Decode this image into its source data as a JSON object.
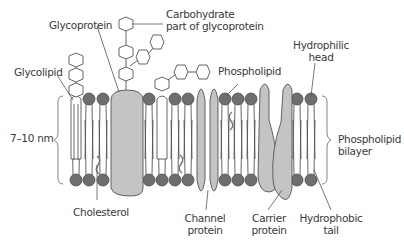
{
  "labels": {
    "glycoprotein": "Glycoprotein",
    "carbohydrate_line1": "Carbohydrate",
    "carbohydrate_line2": "part of glycoprotein",
    "glycolipid": "Glycolipid",
    "phospholipid": "Phospholipid",
    "hydrophilic_line1": "Hydrophilic",
    "hydrophilic_line2": "head",
    "thickness": "7–10 nm",
    "bilayer_line1": "Phospholipid",
    "bilayer_line2": "bilayer",
    "cholesterol": "Cholesterol",
    "channel_line1": "Channel",
    "channel_line2": "protein",
    "carrier_line1": "Carrier",
    "carrier_line2": "protein",
    "hydrophobic_line1": "Hydrophobic",
    "hydrophobic_line2": "tail"
  },
  "colors": {
    "head_fill": "#6e6e6e",
    "protein_fill": "#c4c4c4",
    "line": "#555555",
    "text": "#3a3a3a"
  }
}
